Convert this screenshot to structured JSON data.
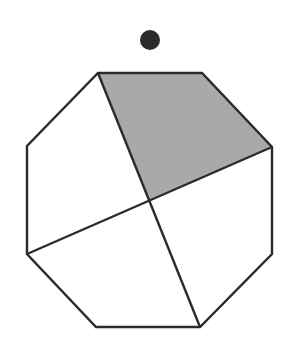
{
  "diagram": {
    "width": 290,
    "height": 346,
    "background": "#ffffff",
    "stroke_color": "#2b2b2b",
    "stroke_width": 2.4,
    "marker_dot": {
      "cx": 150,
      "cy": 40,
      "r": 10,
      "color": "#2b2b2b"
    },
    "octagon": {
      "vertices": [
        [
          98,
          73
        ],
        [
          202,
          73
        ],
        [
          272,
          147
        ],
        [
          272,
          254
        ],
        [
          200,
          327
        ],
        [
          96,
          327
        ],
        [
          27,
          254
        ],
        [
          27,
          146
        ]
      ]
    },
    "center": [
      150,
      200
    ],
    "chords": [
      {
        "from": [
          98,
          73
        ],
        "to": [
          200,
          327
        ]
      },
      {
        "from": [
          272,
          147
        ],
        "to": [
          27,
          254
        ]
      }
    ],
    "shaded_region": {
      "vertices": [
        [
          98,
          73
        ],
        [
          202,
          73
        ],
        [
          272,
          147
        ],
        [
          150,
          200
        ]
      ],
      "fill": "#a9a9a9"
    }
  }
}
